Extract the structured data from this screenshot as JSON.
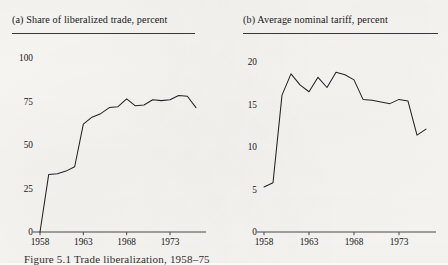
{
  "figure": {
    "caption": "Figure 5.1  Trade liberalization, 1958–75"
  },
  "chart_data": [
    {
      "id": "panel-a",
      "type": "line",
      "title": "(a) Share of liberalized trade, percent",
      "xlabel": "",
      "ylabel": "",
      "grid": false,
      "legend": "none",
      "xlim": [
        1958,
        1976
      ],
      "ylim": [
        0,
        100
      ],
      "yticks": [
        0,
        25,
        50,
        75,
        100
      ],
      "ytick_labels": [
        "0",
        "25",
        "50",
        "75",
        "100"
      ],
      "xticks": [
        1958,
        1963,
        1968,
        1973
      ],
      "xtick_labels": [
        "1958",
        "1963",
        "1968",
        "1973"
      ],
      "x": [
        1958,
        1959,
        1960,
        1961,
        1962,
        1963,
        1964,
        1965,
        1966,
        1967,
        1968,
        1969,
        1970,
        1971,
        1972,
        1973,
        1974,
        1975,
        1976
      ],
      "values": [
        0,
        33,
        33.5,
        35,
        37.5,
        62,
        66,
        68,
        71.5,
        72,
        76.5,
        72.5,
        73,
        76,
        75.5,
        76,
        78.5,
        78,
        71.5
      ],
      "series": [
        {
          "name": "Share of liberalized trade",
          "values": [
            0,
            33,
            33.5,
            35,
            37.5,
            62,
            66,
            68,
            71.5,
            72,
            76.5,
            72.5,
            73,
            76,
            75.5,
            76,
            78.5,
            78,
            71.5
          ]
        }
      ]
    },
    {
      "id": "panel-b",
      "type": "line",
      "title": "(b) Average nominal tariff, percent",
      "xlabel": "",
      "ylabel": "",
      "grid": false,
      "legend": "none",
      "xlim": [
        1958,
        1976
      ],
      "ylim": [
        0,
        20
      ],
      "yticks": [
        0,
        5,
        10,
        15,
        20
      ],
      "ytick_labels": [
        "0",
        "5",
        "10",
        "15",
        "20"
      ],
      "xticks": [
        1958,
        1963,
        1968,
        1973
      ],
      "xtick_labels": [
        "1958",
        "1963",
        "1968",
        "1973"
      ],
      "x": [
        1958,
        1959,
        1960,
        1961,
        1962,
        1963,
        1964,
        1965,
        1966,
        1967,
        1968,
        1969,
        1970,
        1971,
        1972,
        1973,
        1974,
        1975,
        1976
      ],
      "values": [
        5.3,
        5.8,
        16.1,
        18.6,
        17.3,
        16.5,
        18.2,
        17.0,
        18.8,
        18.5,
        17.9,
        15.6,
        15.5,
        15.3,
        15.1,
        15.6,
        15.4,
        11.4,
        12.1
      ],
      "series": [
        {
          "name": "Average nominal tariff",
          "values": [
            5.3,
            5.8,
            16.1,
            18.6,
            17.3,
            16.5,
            18.2,
            17.0,
            18.8,
            18.5,
            17.9,
            15.6,
            15.5,
            15.3,
            15.1,
            15.6,
            15.4,
            11.4,
            12.1
          ]
        }
      ]
    }
  ],
  "style": {
    "line_color": "#242424",
    "axis_color": "#4a4a4a",
    "rule_color": "#3a3a3a",
    "paper_color": "#fbfaf7"
  }
}
